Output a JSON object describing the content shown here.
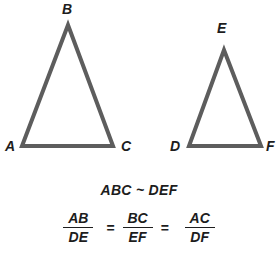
{
  "figure": {
    "stroke_color": "#5d5d5d",
    "label_color": "#1d1d1d",
    "background_color": "#ffffff",
    "stroke_width": 4,
    "triangles": [
      {
        "name": "triangle-abc",
        "vertices": [
          {
            "label": "B",
            "x": 68,
            "y": 25,
            "label_x": 62,
            "label_y": 2
          },
          {
            "label": "C",
            "x": 113,
            "y": 146,
            "label_x": 121,
            "label_y": 139
          },
          {
            "label": "A",
            "x": 22,
            "y": 146,
            "label_x": 5,
            "label_y": 139
          }
        ]
      },
      {
        "name": "triangle-def",
        "vertices": [
          {
            "label": "E",
            "x": 224,
            "y": 50,
            "label_x": 217,
            "label_y": 21
          },
          {
            "label": "F",
            "x": 261,
            "y": 146,
            "label_x": 266,
            "label_y": 139
          },
          {
            "label": "D",
            "x": 189,
            "y": 146,
            "label_x": 170,
            "label_y": 139
          }
        ]
      }
    ]
  },
  "statement": {
    "similarity": "ABC ~ DEF"
  },
  "proportion": {
    "fractions": [
      {
        "numerator": "AB",
        "denominator": "DE"
      },
      {
        "numerator": "BC",
        "denominator": "EF"
      },
      {
        "numerator": "AC",
        "denominator": "DF"
      }
    ],
    "equals": "="
  }
}
